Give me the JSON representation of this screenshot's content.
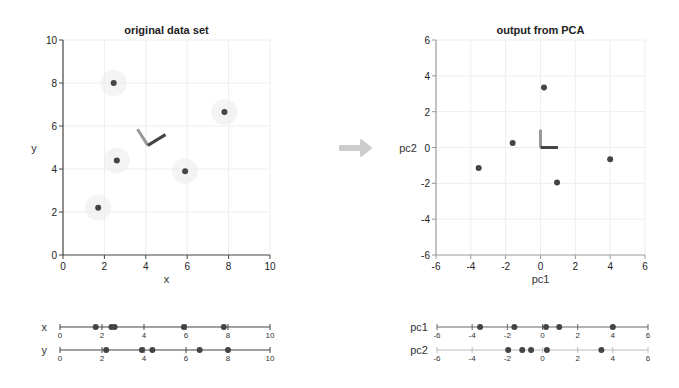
{
  "chart_data": [
    {
      "type": "scatter",
      "title": "original data set",
      "xlabel": "x",
      "ylabel": "y",
      "xlim": [
        0,
        10
      ],
      "ylim": [
        0,
        10
      ],
      "xticks": [
        "0",
        "2",
        "4",
        "6",
        "8",
        "10"
      ],
      "yticks": [
        "0",
        "2",
        "4",
        "6",
        "8",
        "10"
      ],
      "grid": true,
      "points": [
        {
          "x": 2.45,
          "y": 8.0
        },
        {
          "x": 7.8,
          "y": 6.65
        },
        {
          "x": 2.6,
          "y": 4.4
        },
        {
          "x": 5.9,
          "y": 3.9
        },
        {
          "x": 1.7,
          "y": 2.2
        }
      ],
      "vectors": [
        {
          "name": "pc2-direction",
          "from": [
            4.1,
            5.1
          ],
          "to": [
            3.6,
            5.85
          ],
          "color": "#999999"
        },
        {
          "name": "pc1-direction",
          "from": [
            4.1,
            5.1
          ],
          "to": [
            4.95,
            5.6
          ],
          "color": "#444444"
        }
      ]
    },
    {
      "type": "scatter",
      "title": "output from PCA",
      "xlabel": "pc1",
      "ylabel": "pc2",
      "xlim": [
        -6,
        6
      ],
      "ylim": [
        -6,
        6
      ],
      "xticks": [
        "-6",
        "-4",
        "-2",
        "0",
        "2",
        "4",
        "6"
      ],
      "yticks": [
        "-6",
        "-4",
        "-2",
        "0",
        "2",
        "4",
        "6"
      ],
      "grid": true,
      "points": [
        {
          "x": -3.55,
          "y": -1.15
        },
        {
          "x": -1.6,
          "y": 0.25
        },
        {
          "x": 0.2,
          "y": 3.35
        },
        {
          "x": 0.95,
          "y": -1.95
        },
        {
          "x": 4.0,
          "y": -0.65
        }
      ],
      "vectors": [
        {
          "name": "pc2-direction",
          "from": [
            0,
            0
          ],
          "to": [
            0,
            1
          ],
          "color": "#999999"
        },
        {
          "name": "pc1-direction",
          "from": [
            0,
            0
          ],
          "to": [
            1,
            0
          ],
          "color": "#444444"
        }
      ]
    },
    {
      "type": "strip",
      "rows": [
        {
          "label": "x",
          "range": [
            0,
            10
          ],
          "ticks": [
            "0",
            "2",
            "4",
            "6",
            "8",
            "10"
          ],
          "values": [
            1.7,
            2.45,
            2.6,
            5.9,
            7.8
          ]
        },
        {
          "label": "y",
          "range": [
            0,
            10
          ],
          "ticks": [
            "0",
            "2",
            "4",
            "6",
            "8",
            "10"
          ],
          "values": [
            2.2,
            3.9,
            4.4,
            6.65,
            8.0
          ]
        }
      ]
    },
    {
      "type": "strip",
      "rows": [
        {
          "label": "pc1",
          "range": [
            -6,
            6
          ],
          "ticks": [
            "-6",
            "-4",
            "-2",
            "0",
            "2",
            "4",
            "6"
          ],
          "values": [
            -3.55,
            -1.6,
            0.2,
            0.95,
            4.0
          ]
        },
        {
          "label": "pc2",
          "range": [
            -6,
            6
          ],
          "ticks": [
            "-6",
            "-4",
            "-2",
            "0",
            "2",
            "4",
            "6"
          ],
          "values": [
            -1.95,
            -1.15,
            -0.65,
            0.25,
            3.35
          ]
        }
      ]
    }
  ],
  "arrow": {
    "direction": "right",
    "color": "#cccccc"
  },
  "colors": {
    "point": "#444444",
    "axis": "#444444",
    "pc2_label": "#aaaaaa",
    "pc1_label": "#666666",
    "halo": "#ececec"
  }
}
